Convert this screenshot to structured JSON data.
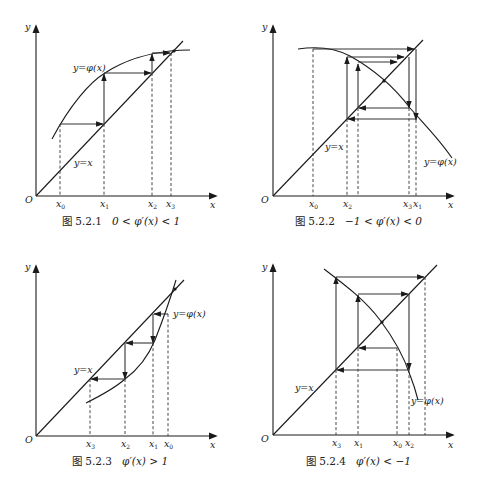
{
  "figures": [
    {
      "id": "5.2.1",
      "caption_prefix": "图 5.2.1",
      "caption_condition": "0 < φ′(x) < 1",
      "axis_x": "x",
      "axis_y": "y",
      "origin": "O",
      "line_label": "y=x",
      "curve_label": "y=φ(x)",
      "ticks": [
        "x0",
        "x1",
        "x2",
        "x3"
      ],
      "behavior": "monotone convergence"
    },
    {
      "id": "5.2.2",
      "caption_prefix": "图 5.2.2",
      "caption_condition": "−1 < φ′(x) < 0",
      "axis_x": "x",
      "axis_y": "y",
      "origin": "O",
      "line_label": "y=x",
      "curve_label": "y=φ(x)",
      "ticks": [
        "x0",
        "x2",
        "x3",
        "x1"
      ],
      "behavior": "oscillating convergence"
    },
    {
      "id": "5.2.3",
      "caption_prefix": "图 5.2.3",
      "caption_condition": "φ′(x) > 1",
      "axis_x": "x",
      "axis_y": "y",
      "origin": "O",
      "line_label": "y=x",
      "curve_label": "y=φ(x)",
      "ticks": [
        "x3",
        "x2",
        "x1",
        "x0"
      ],
      "behavior": "monotone divergence"
    },
    {
      "id": "5.2.4",
      "caption_prefix": "图 5.2.4",
      "caption_condition": "φ′(x) < −1",
      "axis_x": "x",
      "axis_y": "y",
      "origin": "O",
      "line_label": "y=x",
      "curve_label": "y=φ(x)",
      "ticks": [
        "x3",
        "x1",
        "x0",
        "x2"
      ],
      "behavior": "oscillating divergence"
    }
  ]
}
